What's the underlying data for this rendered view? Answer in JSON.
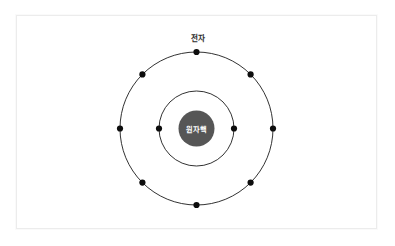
{
  "figure": {
    "title_visible": false,
    "background_color": "#ffffff",
    "card": {
      "border_color": "#ececec",
      "background_color": "#ffffff"
    }
  },
  "diagram": {
    "type": "atomic-bohr-model",
    "center": {
      "x": 196.5,
      "y": 128.5
    },
    "nucleus": {
      "label": "원자핵",
      "radius": 18,
      "fill_color": "#565656",
      "text_color": "#ffffff"
    },
    "orbits": [
      {
        "name": "inner-shell",
        "radius": 37.5,
        "stroke_color": "#1b1b1b",
        "electron_count": 2
      },
      {
        "name": "outer-shell",
        "radius": 76.5,
        "stroke_color": "#1b1b1b",
        "electron_count": 8
      }
    ],
    "electrons": {
      "label": "전자",
      "label_color": "#2c2c2c",
      "dot_color": "#0d0d0d",
      "dot_radius": 3.1,
      "total_count": 10,
      "inner_angles_deg": [
        180,
        0
      ],
      "outer_angles_deg": [
        270,
        315,
        0,
        45,
        90,
        135,
        180,
        225
      ]
    },
    "label_positions": {
      "electron_label": {
        "x": 198,
        "y": 41
      }
    }
  }
}
